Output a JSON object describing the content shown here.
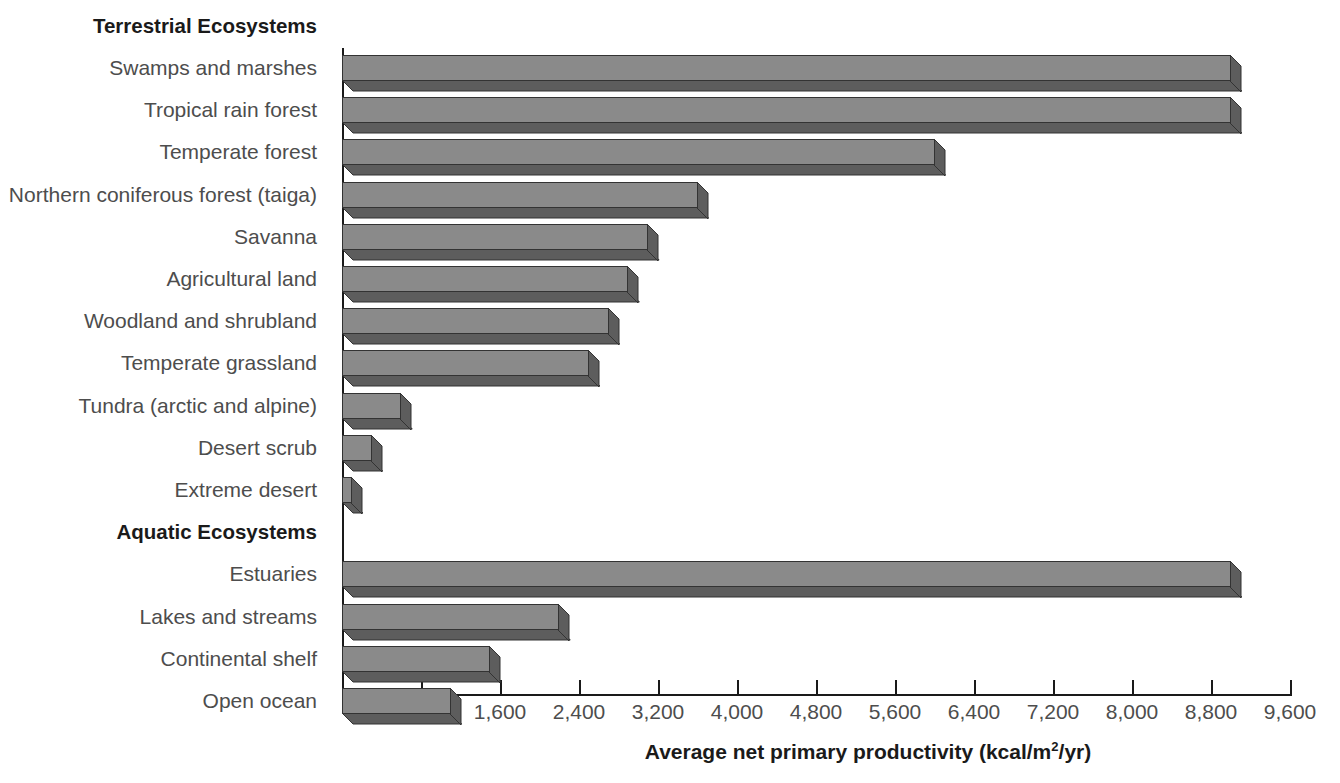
{
  "chart_data": {
    "type": "bar",
    "orientation": "horizontal",
    "title": "",
    "xlabel": "Average net primary productivity (kcal/m2/yr)",
    "xlabel_parts": {
      "before": "Average net primary productivity (kcal/m",
      "sup": "2",
      "after": "/yr)"
    },
    "ylabel": "",
    "xlim": [
      0,
      9600
    ],
    "xticks": [
      800,
      1600,
      2400,
      3200,
      4000,
      4800,
      5600,
      6400,
      7200,
      8000,
      8800,
      9600
    ],
    "xtick_labels": [
      "800",
      "1,600",
      "2,400",
      "3,200",
      "4,000",
      "4,800",
      "5,600",
      "6,400",
      "7,200",
      "8,000",
      "8,800",
      "9,600"
    ],
    "grid": false,
    "legend": false,
    "groups": [
      {
        "header": "Terrestrial Ecosystems",
        "categories": [
          "Swamps and marshes",
          "Tropical rain forest",
          "Temperate forest",
          "Northern coniferous forest (taiga)",
          "Savanna",
          "Agricultural land",
          "Woodland and shrubland",
          "Temperate grassland",
          "Tundra (arctic and alpine)",
          "Desert scrub",
          "Extreme desert"
        ],
        "values": [
          9000,
          9000,
          6000,
          3600,
          3100,
          2900,
          2700,
          2500,
          600,
          300,
          100
        ]
      },
      {
        "header": "Aquatic Ecosystems",
        "categories": [
          "Estuaries",
          "Lakes and streams",
          "Continental shelf",
          "Open ocean"
        ],
        "values": [
          9000,
          2200,
          1500,
          1100
        ]
      }
    ]
  },
  "colors": {
    "bar_front": "#8a8a8a",
    "bar_shade": "#5d5d5d",
    "bar_outline": "#333333",
    "axis": "#1a1a1a",
    "label_text": "#4d4d4d",
    "header_text": "#1a1a1a",
    "background": "#ffffff"
  }
}
